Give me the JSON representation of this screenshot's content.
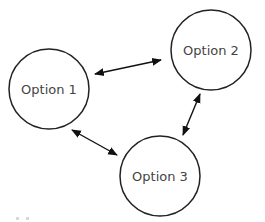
{
  "diagram": {
    "type": "cycle",
    "colors": {
      "node_stroke": "#222222",
      "node_fill": "#ffffff",
      "label": "#444444",
      "edge": "#111111",
      "background": "#ffffff"
    },
    "nodes": [
      {
        "id": "option1",
        "label": "Option 1",
        "cx": 49,
        "cy": 89,
        "r": 40
      },
      {
        "id": "option2",
        "label": "Option 2",
        "cx": 211,
        "cy": 50,
        "r": 40
      },
      {
        "id": "option3",
        "label": "Option 3",
        "cx": 160,
        "cy": 176,
        "r": 40
      }
    ],
    "edges": [
      {
        "from": "option1",
        "to": "option2",
        "bidirectional": true,
        "x1": 95,
        "y1": 74,
        "x2": 161,
        "y2": 60
      },
      {
        "from": "option2",
        "to": "option3",
        "bidirectional": true,
        "x1": 200,
        "y1": 94,
        "x2": 183,
        "y2": 135
      },
      {
        "from": "option3",
        "to": "option1",
        "bidirectional": true,
        "x1": 117,
        "y1": 155,
        "x2": 72,
        "y2": 130
      }
    ]
  }
}
